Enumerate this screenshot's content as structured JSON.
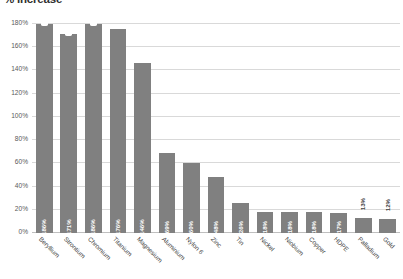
{
  "chart_data": {
    "type": "bar",
    "title": "% increase",
    "xlabel": "",
    "ylabel": "",
    "ylim": [
      0,
      180
    ],
    "ytick_step": 20,
    "grid": true,
    "legend": "none",
    "orientation": "vertical",
    "bar_color": "#808080",
    "gridline_color": "#d9d9d9",
    "categories": [
      "Beryllium",
      "Strontium",
      "Chromium",
      "Titanium",
      "Magnesium",
      "Aluminium",
      "Nylon 6",
      "Zinc",
      "Tin",
      "Nickel",
      "Niobium",
      "Copper",
      "HDPE",
      "Palladium",
      "Gold"
    ],
    "values": [
      186,
      171,
      186,
      176,
      146,
      69,
      60,
      48,
      26,
      18,
      18,
      18,
      17,
      13,
      12
    ],
    "data_labels": [
      "186%",
      "171%",
      "186%",
      "176%",
      "146%",
      "69%",
      "60%",
      "48%",
      "26%",
      "18%",
      "18%",
      "18%",
      "17%",
      "13%",
      "12%"
    ],
    "label_position": [
      "inside",
      "inside",
      "inside",
      "inside",
      "inside",
      "inside",
      "inside",
      "inside",
      "inside",
      "inside",
      "inside",
      "inside",
      "inside",
      "outside",
      "outside"
    ],
    "clipped_bars": [
      true,
      true,
      true,
      false,
      false,
      false,
      false,
      false,
      false,
      false,
      false,
      false,
      false,
      false,
      false
    ],
    "ytick_labels": [
      "0%",
      "20%",
      "40%",
      "60%",
      "80%",
      "100%",
      "120%",
      "140%",
      "160%",
      "180%"
    ],
    "ytick_values": [
      0,
      20,
      40,
      60,
      80,
      100,
      120,
      140,
      160,
      180
    ]
  }
}
